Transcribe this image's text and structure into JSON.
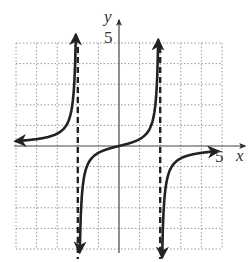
{
  "chart_data": {
    "type": "line",
    "title": "",
    "xlabel": "x",
    "ylabel": "y",
    "xlim": [
      -5,
      5
    ],
    "ylim": [
      -5,
      5
    ],
    "grid": true,
    "grid_step": 1,
    "tick_labels": {
      "x": [
        "5"
      ],
      "y": [
        "5"
      ]
    },
    "vertical_asymptotes": [
      -2,
      2
    ],
    "horizontal_asymptote": 0,
    "function_hint": "y = -x / (x^2 - 4)",
    "series": [
      {
        "name": "left-branch",
        "x": [
          -5,
          -4,
          -3,
          -2.5,
          -2.2,
          -2.1
        ],
        "values": [
          -0.24,
          -0.33,
          -0.6,
          -1.11,
          -2.62,
          -5.1
        ],
        "end_arrows": [
          "left",
          "down"
        ]
      },
      {
        "name": "middle-branch",
        "x": [
          -1.9,
          -1.7,
          -1.5,
          -1,
          0,
          1,
          1.5,
          1.7,
          1.9
        ],
        "values": [
          4.87,
          2.13,
          1.71,
          0.33,
          0,
          -0.33,
          -1.71,
          -2.13,
          -4.87
        ],
        "end_arrows": [
          "up",
          "down"
        ]
      },
      {
        "name": "right-branch",
        "x": [
          2.1,
          2.2,
          2.5,
          3,
          4,
          5
        ],
        "values": [
          5.1,
          2.62,
          1.11,
          0.6,
          0.33,
          0.24
        ],
        "end_arrows": [
          "up",
          "right"
        ]
      }
    ]
  },
  "labels": {
    "x_axis": "x",
    "y_axis": "y",
    "x_tick": "5",
    "y_tick": "5"
  }
}
